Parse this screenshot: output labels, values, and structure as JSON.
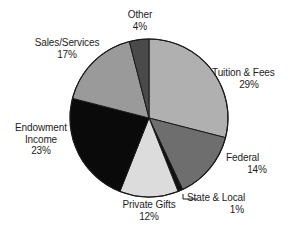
{
  "chart_data": {
    "type": "pie",
    "title": "",
    "subtitle": "",
    "xlabel": "",
    "ylabel": "",
    "legend_position": "none",
    "grid": false,
    "units": "percent",
    "start_angle_deg": 0,
    "direction": "clockwise",
    "categories": [
      "Tuition & Fees",
      "Federal",
      "State & Local",
      "Private Gifts",
      "Endowment Income",
      "Sales/Services",
      "Other"
    ],
    "values": [
      29,
      14,
      1,
      12,
      23,
      17,
      4
    ],
    "slices": [
      {
        "label": "Tuition & Fees",
        "value": 29,
        "value_text": "29%",
        "color": "#b0b0b0",
        "start_deg": 0.0,
        "end_deg": 104.4
      },
      {
        "label": "Federal",
        "value": 14,
        "value_text": "14%",
        "color": "#6e6e6e",
        "start_deg": 104.4,
        "end_deg": 154.8
      },
      {
        "label": "State & Local",
        "value": 1,
        "value_text": "1%",
        "color": "#111111",
        "start_deg": 154.8,
        "end_deg": 158.4
      },
      {
        "label": "Private Gifts",
        "value": 12,
        "value_text": "12%",
        "color": "#dcdcdc",
        "start_deg": 158.4,
        "end_deg": 201.6
      },
      {
        "label": "Endowment Income",
        "value": 23,
        "value_text": "23%",
        "color": "#0a0a0a",
        "start_deg": 201.6,
        "end_deg": 284.4
      },
      {
        "label": "Sales/Services",
        "value": 17,
        "value_text": "17%",
        "color": "#9a9a9a",
        "start_deg": 284.4,
        "end_deg": 345.6
      },
      {
        "label": "Other",
        "value": 4,
        "value_text": "4%",
        "color": "#4a4a4a",
        "start_deg": 345.6,
        "end_deg": 360.0
      }
    ]
  },
  "labels": {
    "other": {
      "name": "Other",
      "pct": "4%"
    },
    "sales": {
      "name": "Sales/Services",
      "pct": "17%"
    },
    "endowment": {
      "name": "Endowment",
      "name2": "Income",
      "pct": "23%"
    },
    "tuition": {
      "name": "Tuition & Fees",
      "pct": "29%"
    },
    "federal": {
      "name": "Federal",
      "pct": "14%"
    },
    "state": {
      "name": "State & Local",
      "pct": "1%"
    },
    "private": {
      "name": "Private Gifts",
      "pct": "12%"
    }
  },
  "style": {
    "background": "#ffffff",
    "outline": "#1a1a1a",
    "text": "#1d1d1d"
  },
  "geometry": {
    "center_x": 149,
    "center_y": 118,
    "radius": 79
  }
}
